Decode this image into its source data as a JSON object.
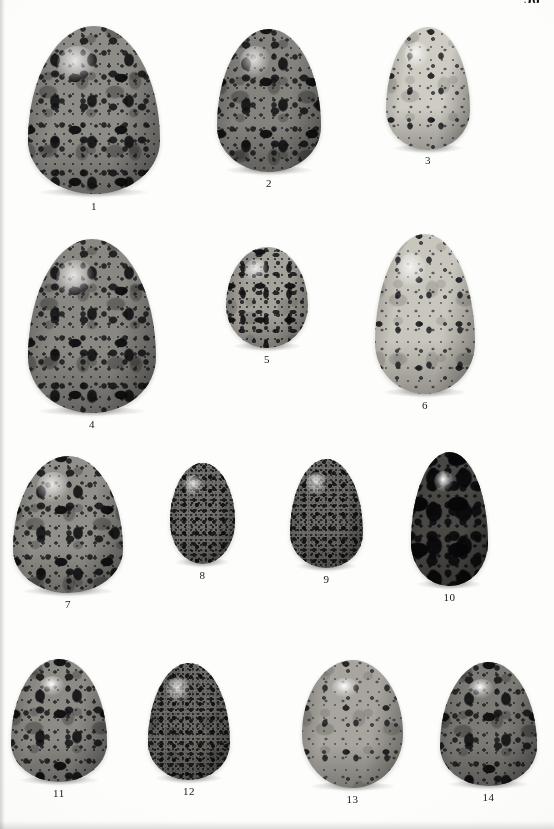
{
  "page": {
    "number": "56",
    "background_color": "#fdfdfb",
    "plate_type": "photographic-plate",
    "caption_color": "#17181c"
  },
  "plate": {
    "rows": 4,
    "egg_count": 14
  },
  "eggs": [
    {
      "label": "1",
      "shape": "pyriform",
      "ground_color": "#8e8c87",
      "pattern": "heavy-blotched",
      "x": 28,
      "y": 26,
      "w": 132,
      "h": 168,
      "caption_y": 174,
      "gloss": "normal",
      "grain": "full"
    },
    {
      "label": "2",
      "shape": "pyriform",
      "ground_color": "#85837e",
      "pattern": "heavy-blotched",
      "x": 217,
      "y": 29,
      "w": 104,
      "h": 143,
      "caption_y": 148,
      "gloss": "normal",
      "grain": "full"
    },
    {
      "label": "3",
      "shape": "pyriform",
      "ground_color": "#cfccc4",
      "pattern": "spotted-pale",
      "x": 386,
      "y": 27,
      "w": 84,
      "h": 123,
      "caption_y": 127,
      "gloss": "normal",
      "grain": "light"
    },
    {
      "label": "4",
      "shape": "pyriform",
      "ground_color": "#8a8883",
      "pattern": "heavy-blotched",
      "x": 28,
      "y": 239,
      "w": 128,
      "h": 174,
      "caption_y": 179,
      "gloss": "normal",
      "grain": "full"
    },
    {
      "label": "5",
      "shape": "ovate",
      "ground_color": "#a5a29b",
      "pattern": "scrawled",
      "x": 226,
      "y": 247,
      "w": 82,
      "h": 101,
      "caption_y": 106,
      "gloss": "normal",
      "grain": "light"
    },
    {
      "label": "6",
      "shape": "pyriform",
      "ground_color": "#c9c6bd",
      "pattern": "spotted-pale",
      "x": 375,
      "y": 234,
      "w": 100,
      "h": 160,
      "caption_y": 165,
      "gloss": "normal",
      "grain": "light"
    },
    {
      "label": "7",
      "shape": "pyriform",
      "ground_color": "#92908a",
      "pattern": "heavy-blotched",
      "x": 13,
      "y": 456,
      "w": 110,
      "h": 137,
      "caption_y": 142,
      "gloss": "normal",
      "grain": "full"
    },
    {
      "label": "8",
      "shape": "ovate",
      "ground_color": "#74726d",
      "pattern": "fine-stippled",
      "x": 170,
      "y": 463,
      "w": 65,
      "h": 101,
      "caption_y": 106,
      "gloss": "normal",
      "grain": "none"
    },
    {
      "label": "9",
      "shape": "pyriform",
      "ground_color": "#706e69",
      "pattern": "fine-stippled",
      "x": 290,
      "y": 459,
      "w": 73,
      "h": 109,
      "caption_y": 114,
      "gloss": "normal",
      "grain": "none"
    },
    {
      "label": "10",
      "shape": "pyriform",
      "ground_color": "#4a4845",
      "pattern": "very-dark-blotched",
      "x": 411,
      "y": 452,
      "w": 77,
      "h": 134,
      "caption_y": 139,
      "gloss": "strong",
      "grain": "none"
    },
    {
      "label": "11",
      "shape": "pyriform",
      "ground_color": "#8d8b86",
      "pattern": "heavy-blotched",
      "x": 11,
      "y": 659,
      "w": 96,
      "h": 123,
      "caption_y": 128,
      "gloss": "strong",
      "grain": "full"
    },
    {
      "label": "12",
      "shape": "pyriform",
      "ground_color": "#6f6d68",
      "pattern": "fine-stippled",
      "x": 148,
      "y": 663,
      "w": 82,
      "h": 117,
      "caption_y": 122,
      "gloss": "normal",
      "grain": "light"
    },
    {
      "label": "13",
      "shape": "ovate",
      "ground_color": "#a8a59e",
      "pattern": "spotted-pale",
      "x": 302,
      "y": 660,
      "w": 101,
      "h": 128,
      "caption_y": 133,
      "gloss": "strong",
      "grain": "light"
    },
    {
      "label": "14",
      "shape": "pyriform",
      "ground_color": "#7c7a75",
      "pattern": "heavy-blotched",
      "x": 440,
      "y": 662,
      "w": 97,
      "h": 124,
      "caption_y": 129,
      "gloss": "strong",
      "grain": "full"
    }
  ]
}
